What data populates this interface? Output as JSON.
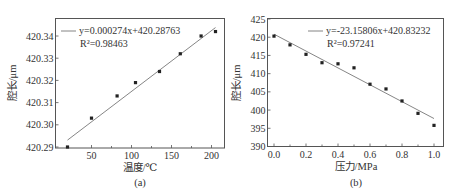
{
  "chart_data": [
    {
      "type": "scatter",
      "panel_label": "(a)",
      "xlabel": "温度/℃",
      "ylabel": "腔长/μm",
      "xlim": [
        0,
        215
      ],
      "ylim": [
        420.2895,
        420.3465
      ],
      "xticks": [
        50,
        100,
        150,
        200
      ],
      "xtick_labels": [
        "50",
        "100",
        "150",
        "200"
      ],
      "yticks": [
        420.29,
        420.3,
        420.31,
        420.32,
        420.33,
        420.34
      ],
      "ytick_labels": [
        "420.29",
        "420.30",
        "420.31",
        "420.32",
        "420.33",
        "420.34"
      ],
      "grid": false,
      "series": [
        {
          "name": "measured",
          "x": [
            20,
            50,
            82,
            105,
            135,
            161,
            187,
            205
          ],
          "y": [
            420.29,
            420.303,
            420.313,
            420.319,
            420.324,
            420.332,
            420.34,
            420.342
          ]
        }
      ],
      "fit": {
        "slope": 0.000274,
        "intercept": 420.28763,
        "x_range": [
          20,
          205
        ]
      },
      "legend": {
        "equation": "y=0.000274x+420.28763",
        "r2": "R²=0.98463",
        "position": "upper left"
      }
    },
    {
      "type": "scatter",
      "panel_label": "(b)",
      "xlabel": "压力/MPa",
      "ylabel": "腔长/μm",
      "xlim": [
        -0.05,
        1.04
      ],
      "ylim": [
        390,
        425
      ],
      "xticks": [
        0.0,
        0.2,
        0.4,
        0.6,
        0.8,
        1.0
      ],
      "xtick_labels": [
        "0.0",
        "0.2",
        "0.4",
        "0.6",
        "0.8",
        "1.0"
      ],
      "yticks": [
        390,
        395,
        400,
        405,
        410,
        415,
        420,
        425
      ],
      "ytick_labels": [
        "390",
        "395",
        "400",
        "405",
        "410",
        "415",
        "420",
        "425"
      ],
      "grid": false,
      "series": [
        {
          "name": "measured",
          "x": [
            0.0,
            0.1,
            0.2,
            0.3,
            0.4,
            0.5,
            0.6,
            0.7,
            0.8,
            0.9,
            1.0
          ],
          "y": [
            420.3,
            417.9,
            415.3,
            413.0,
            412.7,
            411.6,
            407.1,
            405.8,
            402.5,
            399.1,
            395.8
          ]
        }
      ],
      "fit": {
        "slope": -23.15806,
        "intercept": 420.83232,
        "x_range": [
          0.0,
          1.0
        ]
      },
      "legend": {
        "equation": "y=-23.15806x+420.83232",
        "r2": "R²=0.97241",
        "position": "upper right"
      }
    }
  ]
}
